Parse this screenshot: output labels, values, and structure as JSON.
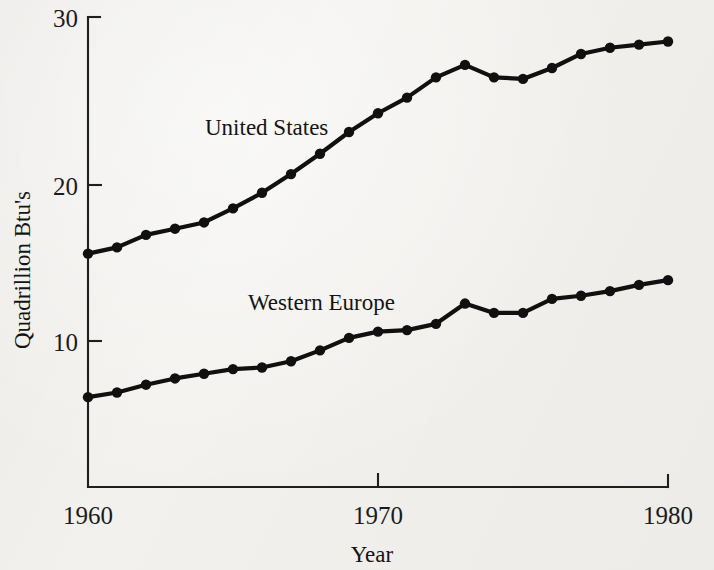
{
  "chart_data": {
    "type": "line",
    "title": "",
    "xlabel": "Year",
    "ylabel": "Quadrillion Btu's",
    "xlim": [
      1960,
      1980
    ],
    "ylim": [
      0,
      30
    ],
    "xticks": [
      1960,
      1970,
      1980
    ],
    "yticks": [
      10,
      20,
      30
    ],
    "xtick_labels": [
      "1960",
      "1970",
      "1980"
    ],
    "ytick_labels": [
      "10",
      "20",
      "30"
    ],
    "grid": false,
    "legend": "inline-annotations",
    "x": [
      1960,
      1961,
      1962,
      1963,
      1964,
      1965,
      1966,
      1967,
      1968,
      1969,
      1970,
      1971,
      1972,
      1973,
      1974,
      1975,
      1976,
      1977,
      1978,
      1979,
      1980
    ],
    "series": [
      {
        "name": "United States",
        "label_x": 1967.1,
        "label_y": 24.4,
        "values": [
          15.6,
          16.0,
          16.8,
          17.2,
          17.6,
          18.5,
          19.5,
          20.7,
          22.0,
          23.4,
          24.6,
          25.6,
          26.9,
          27.7,
          26.9,
          26.8,
          27.5,
          28.4,
          28.8,
          29.0,
          29.2
        ]
      },
      {
        "name": "Western Europe",
        "label_x": 1966.0,
        "label_y": 12.6,
        "values": [
          6.4,
          6.7,
          7.2,
          7.6,
          7.9,
          8.2,
          8.3,
          8.7,
          9.4,
          10.2,
          10.6,
          10.7,
          11.1,
          12.4,
          11.8,
          11.8,
          12.7,
          12.9,
          13.2,
          13.6,
          13.9
        ]
      }
    ]
  },
  "axes": {
    "y_axis_label": "Quadrillion Btu's",
    "x_axis_label": "Year"
  }
}
